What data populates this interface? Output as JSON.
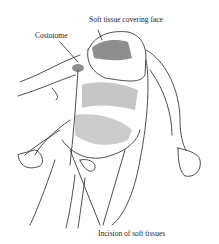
{
  "figure": {
    "labels": {
      "soft_tissue": "Soft tissue covering face",
      "costotome": "Costotome",
      "incision": "Incision of soft tissues"
    },
    "colors": {
      "ink": "#222222",
      "background": "#ffffff"
    }
  }
}
